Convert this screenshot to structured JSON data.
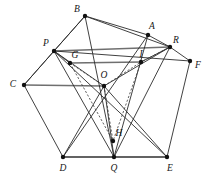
{
  "figure": {
    "width": 211,
    "height": 183,
    "background_color": "#ffffff",
    "line_color": "#2b2b2b",
    "thick_line_color": "#6f6f6f",
    "dashed_line_color": "#3a3a3a",
    "vertex_color": "#111111"
  },
  "vertices": [
    {
      "id": "B",
      "label": "B",
      "x": 85,
      "y": 16,
      "lx": 77,
      "ly": 10,
      "dot": true
    },
    {
      "id": "A",
      "label": "A",
      "x": 148,
      "y": 35,
      "lx": 152,
      "ly": 27,
      "dot": true
    },
    {
      "id": "R",
      "label": "R",
      "x": 170,
      "y": 47,
      "lx": 176,
      "ly": 41,
      "dot": true
    },
    {
      "id": "F",
      "label": "F",
      "x": 190,
      "y": 61,
      "lx": 198,
      "ly": 66,
      "dot": true
    },
    {
      "id": "P",
      "label": "P",
      "x": 54,
      "y": 51,
      "lx": 46,
      "ly": 44,
      "dot": true
    },
    {
      "id": "G",
      "label": "G",
      "x": 70,
      "y": 63,
      "lx": 75,
      "ly": 56,
      "dot": true
    },
    {
      "id": "I",
      "label": "I",
      "x": 141,
      "y": 62,
      "lx": 141,
      "ly": 55,
      "dot": true
    },
    {
      "id": "O",
      "label": "O",
      "x": 104,
      "y": 86,
      "lx": 104,
      "ly": 76,
      "dot": true
    },
    {
      "id": "C",
      "label": "C",
      "x": 24,
      "y": 85,
      "lx": 13,
      "ly": 85,
      "dot": true
    },
    {
      "id": "H",
      "label": "H",
      "x": 113,
      "y": 141,
      "lx": 119,
      "ly": 134,
      "dot": true
    },
    {
      "id": "D",
      "label": "D",
      "x": 63,
      "y": 157,
      "lx": 63,
      "ly": 169,
      "dot": true
    },
    {
      "id": "Q",
      "label": "Q",
      "x": 114,
      "y": 157,
      "lx": 114,
      "ly": 169,
      "dot": true
    },
    {
      "id": "E",
      "label": "E",
      "x": 167,
      "y": 157,
      "lx": 170,
      "ly": 169,
      "dot": true
    }
  ],
  "edges_solid": [
    {
      "from": "C",
      "to": "B"
    },
    {
      "from": "B",
      "to": "A"
    },
    {
      "from": "A",
      "to": "R"
    },
    {
      "from": "R",
      "to": "F"
    },
    {
      "from": "F",
      "to": "E"
    },
    {
      "from": "E",
      "to": "D"
    },
    {
      "from": "D",
      "to": "C"
    },
    {
      "from": "C",
      "to": "P"
    },
    {
      "from": "P",
      "to": "B"
    },
    {
      "from": "B",
      "to": "R"
    },
    {
      "from": "B",
      "to": "Q"
    },
    {
      "from": "A",
      "to": "Q"
    },
    {
      "from": "A",
      "to": "D"
    },
    {
      "from": "P",
      "to": "E"
    },
    {
      "from": "P",
      "to": "Q"
    },
    {
      "from": "R",
      "to": "Q"
    },
    {
      "from": "R",
      "to": "O"
    },
    {
      "from": "P",
      "to": "O"
    },
    {
      "from": "O",
      "to": "D"
    },
    {
      "from": "O",
      "to": "E"
    },
    {
      "from": "O",
      "to": "Q"
    },
    {
      "from": "G",
      "to": "P"
    },
    {
      "from": "I",
      "to": "R"
    },
    {
      "from": "P",
      "to": "F"
    }
  ],
  "edges_thick": [
    {
      "from": "P",
      "to": "R"
    },
    {
      "from": "G",
      "to": "I"
    },
    {
      "from": "C",
      "to": "O"
    },
    {
      "from": "D",
      "to": "Q"
    },
    {
      "from": "Q",
      "to": "E"
    }
  ],
  "edges_dashed": [
    {
      "from": "G",
      "to": "O"
    },
    {
      "from": "O",
      "to": "I"
    },
    {
      "from": "O",
      "to": "H"
    },
    {
      "from": "G",
      "to": "H"
    },
    {
      "from": "I",
      "to": "H"
    },
    {
      "from": "P",
      "to": "G"
    },
    {
      "from": "R",
      "to": "I"
    }
  ]
}
